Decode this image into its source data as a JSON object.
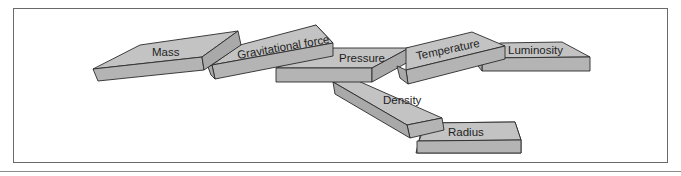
{
  "diagram": {
    "type": "stacked-blocks",
    "blocks": [
      {
        "id": "mass",
        "label": "Mass"
      },
      {
        "id": "gravitational-force",
        "label": "Gravitational force"
      },
      {
        "id": "pressure",
        "label": "Pressure"
      },
      {
        "id": "temperature",
        "label": "Temperature"
      },
      {
        "id": "luminosity",
        "label": "Luminosity"
      },
      {
        "id": "density",
        "label": "Density"
      },
      {
        "id": "radius",
        "label": "Radius"
      }
    ],
    "colors": {
      "block_top": "#c3c3c3",
      "block_front": "#b4b4b4",
      "block_side": "#a9a9a9",
      "outline": "#2a2a2a",
      "frame": "#6a6a6a"
    }
  }
}
